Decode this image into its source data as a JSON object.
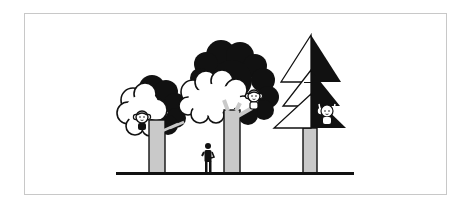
{
  "illustration": {
    "description": "Three trees with monkey characters, a small person standing on the ground",
    "colors": {
      "ink": "#111111",
      "trunk": "#c9c9c9",
      "paper": "#ffffff",
      "frame": "#c8c8c8"
    },
    "elements": {
      "trees": [
        {
          "kind": "round-tree",
          "position": "left",
          "has_monkey": true
        },
        {
          "kind": "round-tree",
          "position": "middle",
          "has_monkey": true
        },
        {
          "kind": "pine-tree",
          "position": "right",
          "has_monkey": true
        }
      ],
      "person": {
        "kind": "standing-person"
      },
      "ground": {
        "kind": "ground-line"
      }
    }
  }
}
